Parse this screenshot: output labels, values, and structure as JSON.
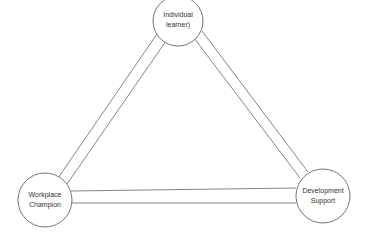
{
  "diagram": {
    "nodes": [
      {
        "id": "learner",
        "lines": [
          "Individual",
          "learner)"
        ]
      },
      {
        "id": "champion",
        "lines": [
          "Workplace",
          "Champion"
        ]
      },
      {
        "id": "support",
        "lines": [
          "Development",
          "Support"
        ]
      }
    ],
    "colors": {
      "stroke": "#666666",
      "text": "#333333",
      "background": "#ffffff"
    }
  }
}
